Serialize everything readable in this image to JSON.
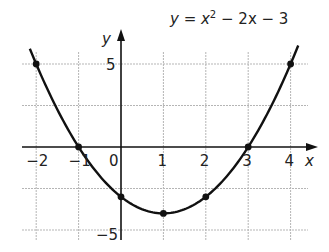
{
  "chart_data": {
    "type": "line",
    "equation": {
      "prefix": "y = x",
      "exponent": "2",
      "suffix": " − 2x − 3"
    },
    "xlabel": "x",
    "ylabel": "y",
    "xlim": [
      -2.25,
      4.4
    ],
    "ylim": [
      -5.5,
      6.5
    ],
    "x_ticks": [
      -2,
      -1,
      0,
      1,
      2,
      3,
      4
    ],
    "x_tick_labels": [
      "−2",
      "−1",
      "0",
      "1",
      "2",
      "3",
      "4"
    ],
    "y_ticks": [
      5,
      -5
    ],
    "y_tick_labels": [
      "5",
      "−5"
    ],
    "grid": true,
    "grid_x": [
      -2,
      -1,
      0,
      1,
      2,
      3,
      4
    ],
    "grid_y": [
      5,
      2.5,
      0,
      -2.5,
      -5
    ],
    "series": [
      {
        "name": "y = x² − 2x − 3",
        "marked_points": [
          {
            "x": -2,
            "y": 5
          },
          {
            "x": -1,
            "y": 0
          },
          {
            "x": 0,
            "y": -3
          },
          {
            "x": 1,
            "y": -4
          },
          {
            "x": 2,
            "y": -3
          },
          {
            "x": 3,
            "y": 0
          },
          {
            "x": 4,
            "y": 5
          }
        ]
      }
    ],
    "colors": {
      "curve": "#111111",
      "axes": "#111111",
      "grid": "#b5b5b5"
    }
  }
}
